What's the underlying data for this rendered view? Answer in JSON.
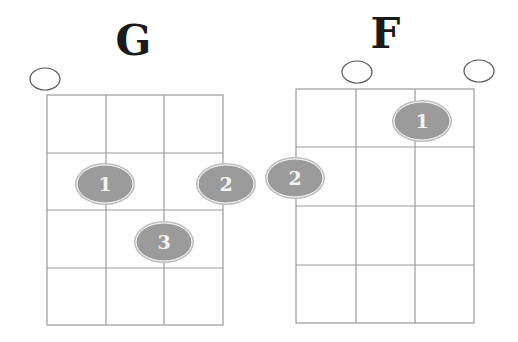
{
  "colors": {
    "grid_line": "#9a9a9a",
    "dot_fill": "#9b9b9b",
    "dot_ring": "#bdbdbd",
    "dot_text": "#f4f4f4",
    "open_circle": "#555555",
    "title": "#1a1a1a"
  },
  "chords": [
    {
      "name": "G",
      "strings": 4,
      "frets": 4,
      "open_strings": [
        1
      ],
      "fingers": [
        {
          "finger": "1",
          "string": 2,
          "fret": 2
        },
        {
          "finger": "2",
          "string": 4,
          "fret": 2
        },
        {
          "finger": "3",
          "string": 3,
          "fret": 3
        }
      ]
    },
    {
      "name": "F",
      "strings": 4,
      "frets": 4,
      "open_strings": [
        2,
        4
      ],
      "fingers": [
        {
          "finger": "1",
          "string": 3,
          "fret": 1
        },
        {
          "finger": "2",
          "string": 1,
          "fret": 2
        }
      ]
    }
  ]
}
